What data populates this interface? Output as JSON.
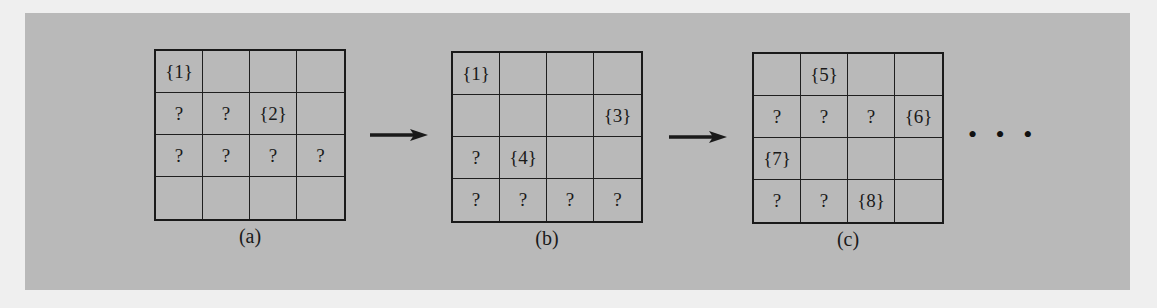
{
  "figure": {
    "panels": [
      {
        "id": "a",
        "label": "(a)",
        "cells": [
          [
            "{1}",
            "",
            "",
            ""
          ],
          [
            "?",
            "?",
            "{2}",
            ""
          ],
          [
            "?",
            "?",
            "?",
            "?"
          ],
          [
            "",
            "",
            "",
            ""
          ]
        ]
      },
      {
        "id": "b",
        "label": "(b)",
        "cells": [
          [
            "{1}",
            "",
            "",
            ""
          ],
          [
            "",
            "",
            "",
            "{3}"
          ],
          [
            "?",
            "{4}",
            "",
            ""
          ],
          [
            "?",
            "?",
            "?",
            "?"
          ]
        ]
      },
      {
        "id": "c",
        "label": "(c)",
        "cells": [
          [
            "",
            "{5}",
            "",
            ""
          ],
          [
            "?",
            "?",
            "?",
            "{6}"
          ],
          [
            "{7}",
            "",
            "",
            ""
          ],
          [
            "?",
            "?",
            "{8}",
            ""
          ]
        ]
      }
    ],
    "arrows": [
      {
        "from": "a",
        "to": "b"
      },
      {
        "from": "b",
        "to": "c"
      }
    ],
    "continuation": "• • •"
  },
  "colors": {
    "page_background": "#efefef",
    "panel_background": "#b9b9b9",
    "ink": "#1a1a1a"
  }
}
